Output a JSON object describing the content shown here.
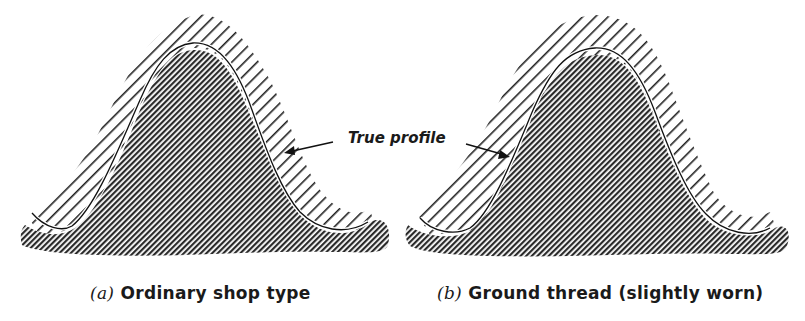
{
  "figure": {
    "panels": [
      {
        "id": "a",
        "caption_letter": "(a)",
        "caption_text": "Ordinary shop type"
      },
      {
        "id": "b",
        "caption_letter": "(b)",
        "caption_text": "Ground thread (slightly worn)"
      }
    ],
    "annotation": {
      "label": "True profile"
    },
    "colors": {
      "ink": "#1a1a1a",
      "paper": "#ffffff"
    }
  }
}
